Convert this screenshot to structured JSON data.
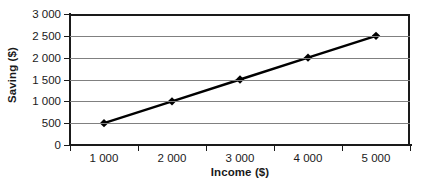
{
  "chart_data": {
    "type": "line",
    "title": "",
    "xlabel": "Income ($)",
    "ylabel": "Saving ($)",
    "categories": [
      1000,
      2000,
      3000,
      4000,
      5000
    ],
    "category_labels": [
      "1 000",
      "2 000",
      "3 000",
      "4 000",
      "5 000"
    ],
    "values": [
      500,
      1000,
      1500,
      2000,
      2500
    ],
    "series": [
      {
        "name": "Saving",
        "values": [
          500,
          1000,
          1500,
          2000,
          2500
        ],
        "color": "#000000",
        "marker": "diamond"
      }
    ],
    "ylim": [
      0,
      3000
    ],
    "ytick_values": [
      0,
      500,
      1000,
      1500,
      2000,
      2500,
      3000
    ],
    "ytick_labels": [
      "0",
      "500",
      "1 000",
      "1 500",
      "2 000",
      "2 500",
      "3 000"
    ],
    "grid": true,
    "grid_axis": "y",
    "legend": false,
    "legend_position": "none",
    "axis_color": "#1a1a1a",
    "gridline_color": "#808080",
    "background_color": "#ffffff"
  }
}
